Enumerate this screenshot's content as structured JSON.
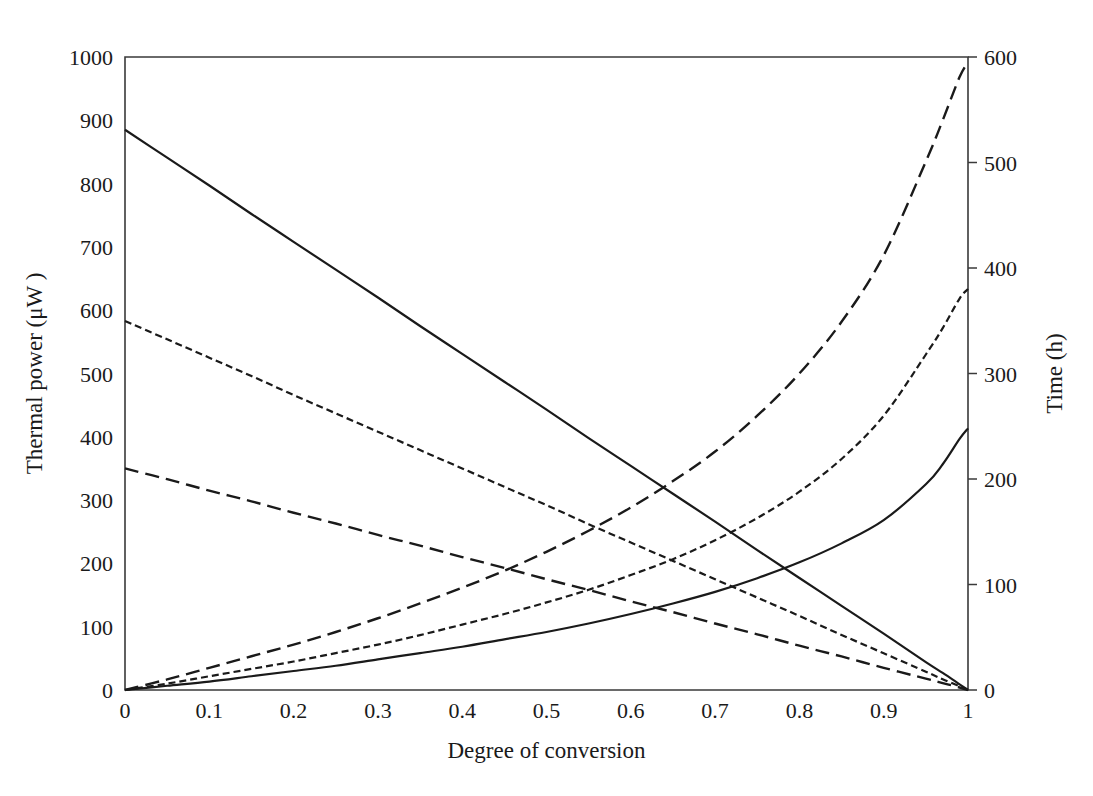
{
  "chart_data": {
    "type": "line",
    "title": "",
    "xlabel": "Degree of conversion",
    "ylabel": "Thermal power (μW )",
    "y2label": "Time (h)",
    "xlim": [
      0,
      1
    ],
    "ylim": [
      0,
      1000
    ],
    "y2lim": [
      0,
      600
    ],
    "grid": false,
    "legend": "none",
    "xticks": [
      "0",
      "0.1",
      "0.2",
      "0.3",
      "0.4",
      "0.5",
      "0.6",
      "0.7",
      "0.8",
      "0.9",
      "1"
    ],
    "xtick_values": [
      0,
      0.1,
      0.2,
      0.3,
      0.4,
      0.5,
      0.6,
      0.7,
      0.8,
      0.9,
      1
    ],
    "yticks": [
      "0",
      "100",
      "200",
      "300",
      "400",
      "500",
      "600",
      "700",
      "800",
      "900",
      "1000"
    ],
    "ytick_values": [
      0,
      100,
      200,
      300,
      400,
      500,
      600,
      700,
      800,
      900,
      1000
    ],
    "y2ticks": [
      "0",
      "100",
      "200",
      "300",
      "400",
      "500",
      "600"
    ],
    "y2tick_values": [
      0,
      100,
      200,
      300,
      400,
      500,
      600
    ],
    "x": [
      0,
      0.05,
      0.1,
      0.15,
      0.2,
      0.25,
      0.3,
      0.35,
      0.4,
      0.45,
      0.5,
      0.55,
      0.6,
      0.65,
      0.7,
      0.75,
      0.8,
      0.85,
      0.9,
      0.95,
      0.97,
      0.99,
      1
    ],
    "series": [
      {
        "name": "Thermal power - solid",
        "axis": "left",
        "style": "solid",
        "units": "μW",
        "values": [
          885,
          841,
          797,
          752,
          708,
          664,
          620,
          575,
          531,
          487,
          443,
          398,
          354,
          310,
          266,
          221,
          177,
          133,
          89,
          44,
          27,
          9,
          0
        ]
      },
      {
        "name": "Thermal power - short dash",
        "axis": "left",
        "style": "short-dash",
        "units": "μW",
        "values": [
          583,
          554,
          525,
          496,
          466,
          437,
          408,
          379,
          350,
          321,
          292,
          262,
          233,
          204,
          175,
          146,
          117,
          87,
          58,
          29,
          17,
          6,
          0
        ]
      },
      {
        "name": "Thermal power - long dash",
        "axis": "left",
        "style": "long-dash",
        "units": "μW",
        "values": [
          350,
          333,
          315,
          298,
          280,
          263,
          245,
          228,
          210,
          193,
          175,
          158,
          140,
          123,
          105,
          88,
          70,
          53,
          35,
          18,
          11,
          4,
          0
        ]
      },
      {
        "name": "Time - solid",
        "axis": "right",
        "style": "solid",
        "units": "h",
        "values": [
          0,
          4,
          8,
          13,
          18,
          23,
          29,
          35,
          41,
          48,
          55,
          63,
          72,
          82,
          93,
          106,
          121,
          139,
          161,
          195,
          214,
          238,
          248
        ]
      },
      {
        "name": "Time - short dash",
        "axis": "right",
        "style": "short-dash",
        "units": "h",
        "values": [
          0,
          6,
          13,
          20,
          27,
          35,
          43,
          52,
          62,
          72,
          83,
          95,
          109,
          124,
          142,
          163,
          188,
          219,
          260,
          318,
          343,
          371,
          380
        ]
      },
      {
        "name": "Time - long dash",
        "axis": "right",
        "style": "long-dash",
        "units": "h",
        "values": [
          0,
          10,
          21,
          32,
          43,
          55,
          68,
          82,
          97,
          113,
          131,
          151,
          173,
          198,
          226,
          260,
          300,
          349,
          412,
          501,
          540,
          581,
          595
        ]
      }
    ]
  },
  "axes": {
    "x_title": "Degree of conversion",
    "y_left_title": "Thermal power (μW )",
    "y_right_title": "Time (h)"
  },
  "colors": {
    "line": "#1a1a1a",
    "frame": "#3a3a3a",
    "background": "#ffffff"
  }
}
